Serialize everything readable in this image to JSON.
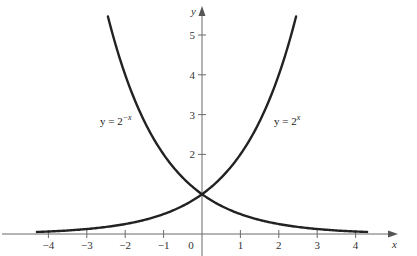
{
  "chart_data": {
    "type": "line",
    "title": "",
    "xlabel": "x",
    "ylabel": "y",
    "xlim": [
      -4.3,
      4.5
    ],
    "ylim": [
      0,
      5.8
    ],
    "grid": false,
    "legend": "none (inline curve labels)",
    "x_ticks": [
      -4,
      -3,
      -2,
      -1,
      0,
      1,
      2,
      3,
      4
    ],
    "x_tick_labels": [
      "−4",
      "−3",
      "−2",
      "−1",
      "0",
      "1",
      "2",
      "3",
      "4"
    ],
    "y_ticks": [
      2,
      3,
      4,
      5
    ],
    "y_tick_labels": [
      "2",
      "3",
      "4",
      "5"
    ],
    "series": [
      {
        "name": "y = 2^x",
        "label_base": "y = 2",
        "label_exponent": "x",
        "x": [
          -4.3,
          -4,
          -3,
          -2,
          -1,
          0,
          1,
          2,
          2.5
        ],
        "values": [
          0.05,
          0.0625,
          0.125,
          0.25,
          0.5,
          1,
          2,
          4,
          5.66
        ]
      },
      {
        "name": "y = 2^-x",
        "label_base": "y = 2",
        "label_exponent": "−x",
        "x": [
          -2.5,
          -2,
          -1,
          0,
          1,
          2,
          3,
          4,
          4.3
        ],
        "values": [
          5.66,
          4,
          2,
          1,
          0.5,
          0.25,
          0.125,
          0.0625,
          0.05
        ]
      }
    ],
    "annotations": [
      {
        "text": "y = 2^−x",
        "near": [
          -2.1,
          2.9
        ]
      },
      {
        "text": "y = 2^x",
        "near": [
          2.1,
          2.9
        ]
      }
    ],
    "intersection": {
      "x": 0,
      "y": 1
    }
  },
  "labels": {
    "x_axis": "x",
    "y_axis": "y",
    "origin": "0",
    "eq_left_base": "y = 2",
    "eq_left_exp": "−x",
    "eq_right_base": "y = 2",
    "eq_right_exp": "x"
  },
  "colors": {
    "curve": "#222222",
    "axis": "#6b6b6b",
    "background": "#ffffff"
  }
}
